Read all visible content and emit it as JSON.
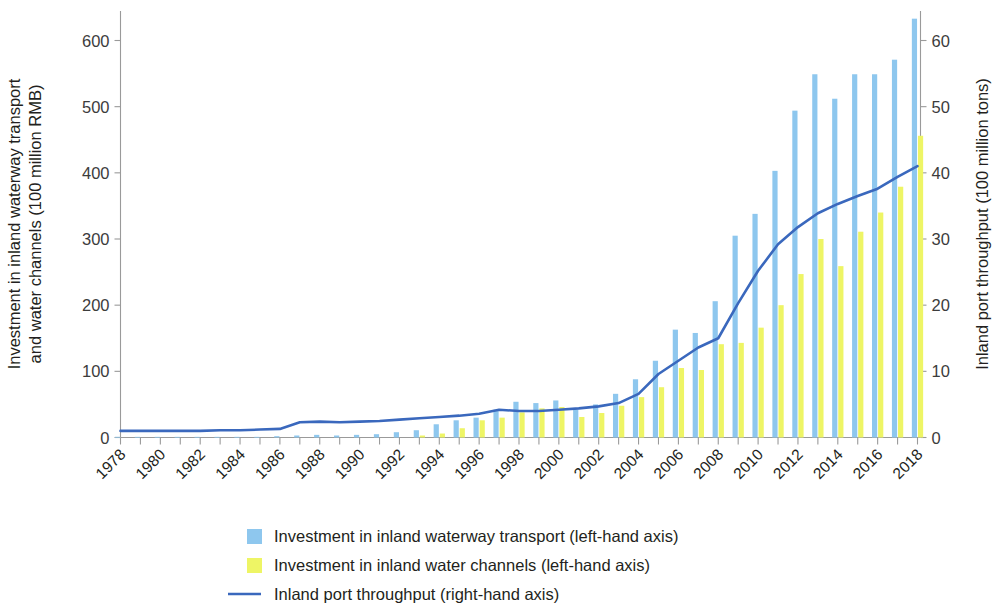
{
  "chart_data": {
    "type": "bar",
    "title": "",
    "subtitle": "",
    "xlabel": "",
    "ylabel": "Investment in inland waterway transport and water channels (100 million RMB)",
    "y2label": "Inland port throughput (100 million tons)",
    "ylim": [
      0,
      650
    ],
    "y2lim": [
      0,
      65
    ],
    "yticks": [
      "0",
      "100",
      "200",
      "300",
      "400",
      "500",
      "600"
    ],
    "ytick_values": [
      0,
      100,
      200,
      300,
      400,
      500,
      600
    ],
    "y2ticks": [
      "0",
      "10",
      "20",
      "30",
      "40",
      "50",
      "60"
    ],
    "y2tick_values": [
      0,
      10,
      20,
      30,
      40,
      50,
      60
    ],
    "grid": false,
    "legend_position": "bottom",
    "x": [
      1978,
      1979,
      1980,
      1981,
      1982,
      1983,
      1984,
      1985,
      1986,
      1987,
      1988,
      1989,
      1990,
      1991,
      1992,
      1993,
      1994,
      1995,
      1996,
      1997,
      1998,
      1999,
      2000,
      2001,
      2002,
      2003,
      2004,
      2005,
      2006,
      2007,
      2008,
      2009,
      2010,
      2011,
      2012,
      2013,
      2014,
      2015,
      2016,
      2017,
      2018
    ],
    "xtick_labels": [
      "1978",
      "1980",
      "1982",
      "1984",
      "1986",
      "1988",
      "1990",
      "1992",
      "1994",
      "1996",
      "1998",
      "2000",
      "2002",
      "2004",
      "2006",
      "2008",
      "2010",
      "2012",
      "2014",
      "2016",
      "2018"
    ],
    "xtick_values": [
      1978,
      1980,
      1982,
      1984,
      1986,
      1988,
      1990,
      1992,
      1994,
      1996,
      1998,
      2000,
      2002,
      2004,
      2006,
      2008,
      2010,
      2012,
      2014,
      2016,
      2018
    ],
    "series": [
      {
        "name": "Investment in inland waterway transport (left-hand axis)",
        "type": "bar",
        "axis": "left",
        "color": "#8ec7ee",
        "values": [
          1,
          1,
          1,
          1,
          1,
          1,
          1,
          1,
          2,
          3,
          4,
          3,
          4,
          5,
          8,
          11,
          20,
          26,
          30,
          42,
          54,
          52,
          56,
          42,
          50,
          66,
          88,
          116,
          163,
          158,
          206,
          305,
          338,
          403,
          494,
          549,
          512,
          549,
          549,
          571,
          633
        ]
      },
      {
        "name": "Investment in inland water channels (left-hand axis)",
        "type": "bar",
        "axis": "left",
        "color": "#eef565",
        "values": [
          0,
          0,
          0,
          0,
          0,
          0,
          0,
          0,
          0,
          0,
          0,
          0,
          0,
          0,
          0,
          3,
          6,
          14,
          26,
          30,
          38,
          44,
          46,
          31,
          37,
          48,
          61,
          76,
          105,
          102,
          141,
          143,
          166,
          200,
          247,
          300,
          259,
          311,
          340,
          379,
          456
        ]
      },
      {
        "name": "Inland port throughput (right-hand axis)",
        "type": "line",
        "axis": "right",
        "color": "#3a68bd",
        "values": [
          1.0,
          1.0,
          1.0,
          1.0,
          1.0,
          1.1,
          1.1,
          1.2,
          1.3,
          2.3,
          2.4,
          2.3,
          2.4,
          2.5,
          2.7,
          2.9,
          3.1,
          3.3,
          3.6,
          4.2,
          4.0,
          4.0,
          4.2,
          4.4,
          4.7,
          5.2,
          6.6,
          9.6,
          11.6,
          13.6,
          15.0,
          20.3,
          25.2,
          29.2,
          31.8,
          33.9,
          35.3,
          36.5,
          37.6,
          39.4,
          41.0
        ]
      }
    ],
    "legend": [
      {
        "label": "Investment in inland waterway transport (left-hand axis)",
        "marker": "square",
        "color": "#8ec7ee"
      },
      {
        "label": "Investment in inland water channels (left-hand axis)",
        "marker": "square",
        "color": "#eef565"
      },
      {
        "label": "Inland port throughput (right-hand axis)",
        "marker": "line",
        "color": "#3a68bd"
      }
    ]
  },
  "colors": {
    "bar_transport": "#8ec7ee",
    "bar_channels": "#eef565",
    "line_throughput": "#3a68bd",
    "axis": "#9a9a9a",
    "text": "#231f20"
  }
}
